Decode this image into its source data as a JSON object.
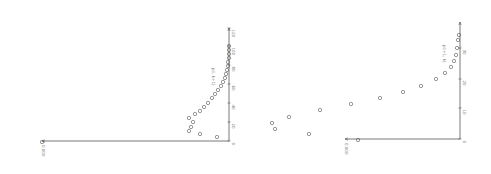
{
  "figure": {
    "stroke_color": "#555555",
    "marker_color": "#555555",
    "background": "#ffffff"
  },
  "chart_data": [
    {
      "type": "scatter",
      "title": "",
      "panel": "left",
      "rotated": true,
      "annotation": "p(i, k+1)",
      "xlabel": "",
      "ylabel": "",
      "axis_pixels": {
        "corner": [
          229,
          141
        ],
        "vertical_top": 28,
        "horizontal_left": 42
      },
      "tick_labels_vertical": [
        "0",
        "20",
        "40",
        "60",
        "80",
        "100",
        "120"
      ],
      "tick_y_pixels": [
        141,
        122,
        103,
        84,
        65,
        46,
        28
      ],
      "origin_label": "0.000",
      "points_pixels": [
        [
          229,
          46
        ],
        [
          229,
          50
        ],
        [
          229,
          54
        ],
        [
          229,
          58
        ],
        [
          228,
          62
        ],
        [
          228,
          66
        ],
        [
          227,
          70
        ],
        [
          226,
          74
        ],
        [
          225,
          78
        ],
        [
          223,
          82
        ],
        [
          221,
          86
        ],
        [
          218,
          90
        ],
        [
          215,
          94
        ],
        [
          212,
          98
        ],
        [
          208,
          103
        ],
        [
          204,
          107
        ],
        [
          200,
          111
        ],
        [
          195,
          114
        ],
        [
          189,
          118
        ],
        [
          193,
          122
        ],
        [
          191,
          127
        ],
        [
          189,
          131
        ],
        [
          200,
          134
        ],
        [
          217,
          137
        ],
        [
          42,
          142
        ]
      ]
    },
    {
      "type": "scatter",
      "title": "",
      "panel": "right",
      "rotated": true,
      "annotation": "p(i+1, k)",
      "xlabel": "",
      "ylabel": "",
      "axis_pixels": {
        "corner": [
          460,
          139
        ],
        "vertical_top": 22,
        "horizontal_left": 345
      },
      "tick_labels_vertical": [
        "0",
        "10",
        "20",
        "30"
      ],
      "tick_y_pixels": [
        139,
        108,
        79,
        48
      ],
      "origin_label": "0.000",
      "points_pixels": [
        [
          459,
          35
        ],
        [
          458,
          40
        ],
        [
          457,
          48
        ],
        [
          456,
          55
        ],
        [
          454,
          61
        ],
        [
          451,
          67
        ],
        [
          445,
          73
        ],
        [
          436,
          79
        ],
        [
          421,
          86
        ],
        [
          403,
          92
        ],
        [
          380,
          98
        ],
        [
          351,
          104
        ],
        [
          320,
          110
        ],
        [
          289,
          117
        ],
        [
          272,
          123
        ],
        [
          275,
          129
        ],
        [
          309,
          134
        ],
        [
          358,
          140
        ]
      ]
    }
  ]
}
